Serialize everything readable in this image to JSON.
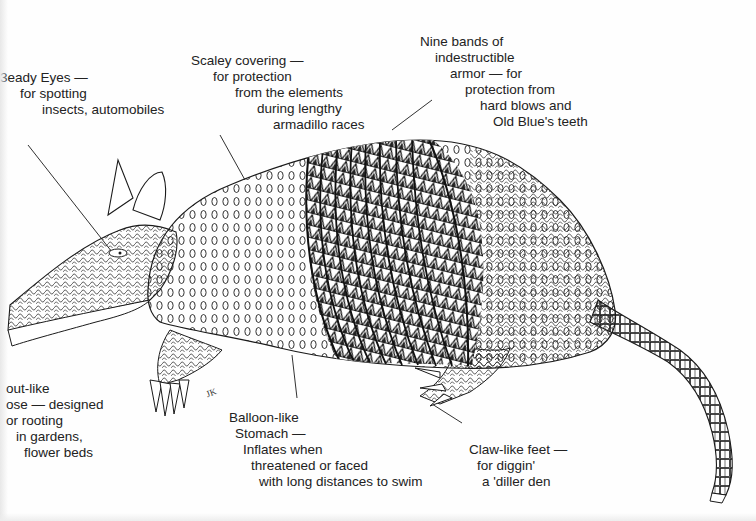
{
  "diagram": {
    "labels": {
      "eyes": {
        "lines": [
          "3eady Eyes —",
          "for spotting",
          "insects, automobiles"
        ]
      },
      "scales": {
        "lines": [
          "Scaley covering —",
          "for protection",
          "from the elements",
          "during lengthy",
          "armadillo races"
        ]
      },
      "bands": {
        "lines": [
          "Nine bands of",
          "indestructible",
          "armor — for",
          "protection from",
          "hard blows and",
          "Old Blue's teeth"
        ]
      },
      "snout": {
        "lines": [
          "out-like",
          "ose — designed",
          "or rooting",
          "in gardens,",
          "flower beds"
        ]
      },
      "stomach": {
        "lines": [
          "Balloon-like",
          "Stomach —",
          "Inflates when",
          "threatened or faced",
          "with long distances to swim"
        ]
      },
      "feet": {
        "lines": [
          "Claw-like feet —",
          "for diggin'",
          "a 'diller den"
        ]
      }
    },
    "signature": "JK",
    "colors": {
      "ink": "#1a1a1a",
      "paper": "#fefefe"
    }
  }
}
